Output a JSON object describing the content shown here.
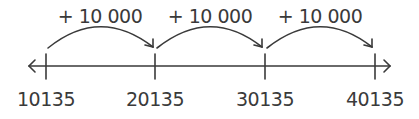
{
  "number_line": {
    "ticks": [
      {
        "value": "10135",
        "x": 46
      },
      {
        "value": "20135",
        "x": 155
      },
      {
        "value": "30135",
        "x": 265
      },
      {
        "value": "40135",
        "x": 375
      }
    ],
    "jumps": [
      {
        "label": "+ 10 000",
        "from": "10135",
        "to": "20135"
      },
      {
        "label": "+ 10 000",
        "from": "20135",
        "to": "30135"
      },
      {
        "label": "+ 10 000",
        "from": "30135",
        "to": "40135"
      }
    ],
    "line_color": "#3a3a3a"
  }
}
